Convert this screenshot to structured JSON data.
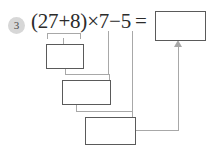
{
  "worksheet": {
    "problem_number": "3",
    "equation": "(27+8)×7−5 =",
    "equation_plain": "(27+8)×7−5 =",
    "colors": {
      "badge_background": "#d7d7d7",
      "badge_text": "#4a4a4a",
      "equation_text": "#2b2b2b",
      "box_border": "#5a5a5a",
      "box_fill": "#ffffff",
      "connector_line": "#a8a8a8",
      "page_background": "#ffffff"
    },
    "boxes": [
      {
        "id": "answer",
        "label": "answer-box",
        "value": "",
        "placeholder": ""
      },
      {
        "id": "step1",
        "label": "step-1-box",
        "value": "",
        "placeholder": ""
      },
      {
        "id": "step2",
        "label": "step-2-box",
        "value": "",
        "placeholder": ""
      },
      {
        "id": "step3",
        "label": "step-3-box",
        "value": "",
        "placeholder": ""
      }
    ],
    "connectors": [
      {
        "id": "bracket-27-plus-8",
        "from": "(27+8)",
        "to": "step1"
      },
      {
        "id": "step1-to-step2",
        "from": "step1",
        "to": "step2"
      },
      {
        "id": "times-7-to-step2",
        "from": "×7",
        "to": "step2"
      },
      {
        "id": "step2-to-step3",
        "from": "step2",
        "to": "step3"
      },
      {
        "id": "minus-5-to-step3",
        "from": "−5",
        "to": "step3"
      },
      {
        "id": "step3-to-answer",
        "from": "step3",
        "to": "answer",
        "arrow": "up"
      }
    ]
  }
}
